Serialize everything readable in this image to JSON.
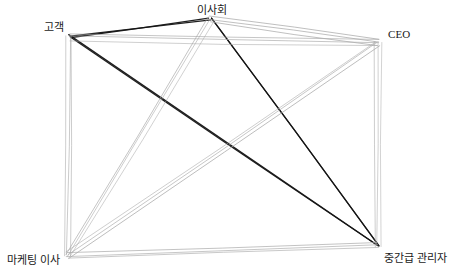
{
  "diagram": {
    "type": "node-link-graph",
    "style": "hand-drawn-sketch",
    "background_color": "#ffffff",
    "canvas": {
      "width": 451,
      "height": 278
    },
    "colors": {
      "edge_normal": "#a9a9a9",
      "edge_highlight": "#141414",
      "label_text": "#1a1a1a"
    },
    "nodes": [
      {
        "id": "customer",
        "label": "고객",
        "x": 70,
        "y": 36,
        "label_x": 64,
        "label_y": 33,
        "label_anchor": "anchor-right"
      },
      {
        "id": "board",
        "label": "이사회",
        "x": 210,
        "y": 19,
        "label_x": 212,
        "label_y": 16,
        "label_anchor": "anchor-center"
      },
      {
        "id": "ceo",
        "label": "CEO",
        "x": 378,
        "y": 43,
        "label_x": 388,
        "label_y": 40,
        "label_anchor": "anchor-left"
      },
      {
        "id": "marketing-director",
        "label": "마케팅 이사",
        "x": 67,
        "y": 256,
        "label_x": 60,
        "label_y": 254,
        "label_anchor": "anchor-br"
      },
      {
        "id": "middle-manager",
        "label": "중간급 관리자",
        "x": 378,
        "y": 246,
        "label_x": 384,
        "label_y": 252,
        "label_anchor": "anchor-bl"
      }
    ],
    "edges": [
      {
        "from": "customer",
        "to": "board",
        "highlight": true
      },
      {
        "from": "board",
        "to": "middle-manager",
        "highlight": true
      },
      {
        "from": "customer",
        "to": "middle-manager",
        "highlight": true
      },
      {
        "from": "customer",
        "to": "ceo",
        "highlight": false
      },
      {
        "from": "customer",
        "to": "marketing-director",
        "highlight": false
      },
      {
        "from": "board",
        "to": "ceo",
        "highlight": false
      },
      {
        "from": "board",
        "to": "marketing-director",
        "highlight": false
      },
      {
        "from": "ceo",
        "to": "marketing-director",
        "highlight": false
      },
      {
        "from": "ceo",
        "to": "middle-manager",
        "highlight": false
      },
      {
        "from": "marketing-director",
        "to": "middle-manager",
        "highlight": false
      }
    ]
  }
}
